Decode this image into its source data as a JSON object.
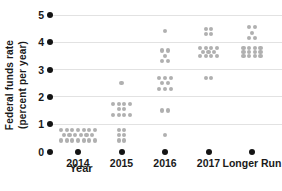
{
  "chart_data": {
    "type": "scatter",
    "variant": "fomc-dot-plot",
    "ylabel_line1": "Federal funds rate",
    "ylabel_line2": "(percent per year)",
    "xlabel": "Year",
    "y_ticks": [
      5,
      4,
      3,
      2,
      1,
      0
    ],
    "ylim": [
      0,
      5
    ],
    "grid": "horizontal gridlines at y = 1,2,3,4,5; none at 0",
    "legend": "none",
    "x_categories": [
      "2014",
      "2015",
      "2016",
      "2017",
      "Longer Run"
    ],
    "dot_clusters": [
      {
        "category": "2014",
        "rows": [
          {
            "value": 0.8,
            "count": 7
          },
          {
            "value": 0.6,
            "count": 6
          },
          {
            "value": 0.4,
            "count": 7
          }
        ]
      },
      {
        "category": "2015",
        "rows": [
          {
            "value": 2.5,
            "count": 1
          },
          {
            "value": 1.75,
            "count": 4
          },
          {
            "value": 1.55,
            "count": 2
          },
          {
            "value": 1.35,
            "count": 4
          },
          {
            "value": 0.8,
            "count": 2
          },
          {
            "value": 0.6,
            "count": 2
          },
          {
            "value": 0.4,
            "count": 2
          }
        ]
      },
      {
        "category": "2016",
        "rows": [
          {
            "value": 4.4,
            "count": 1
          },
          {
            "value": 3.7,
            "count": 2
          },
          {
            "value": 3.5,
            "count": 1
          },
          {
            "value": 3.3,
            "count": 2
          },
          {
            "value": 2.7,
            "count": 3
          },
          {
            "value": 2.5,
            "count": 2
          },
          {
            "value": 2.3,
            "count": 3
          },
          {
            "value": 1.5,
            "count": 2
          },
          {
            "value": 0.6,
            "count": 1
          }
        ]
      },
      {
        "category": "2017",
        "rows": [
          {
            "value": 4.5,
            "count": 2
          },
          {
            "value": 4.3,
            "count": 2
          },
          {
            "value": 3.8,
            "count": 4
          },
          {
            "value": 3.65,
            "count": 3
          },
          {
            "value": 3.5,
            "count": 4
          },
          {
            "value": 2.7,
            "count": 2
          }
        ]
      },
      {
        "category": "Longer Run",
        "rows": [
          {
            "value": 4.55,
            "count": 2
          },
          {
            "value": 4.35,
            "count": 1
          },
          {
            "value": 4.15,
            "count": 2
          },
          {
            "value": 3.8,
            "count": 4
          },
          {
            "value": 3.65,
            "count": 4
          },
          {
            "value": 3.5,
            "count": 4
          }
        ]
      }
    ],
    "colors": {
      "data_dot": "#b0b0b0",
      "axis_dot": "#141414",
      "gridline": "#e2e2e2",
      "text": "#1a1a1a",
      "background": "#ffffff"
    }
  }
}
